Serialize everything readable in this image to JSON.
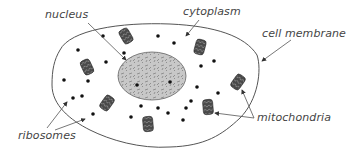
{
  "diagram": {
    "colors": {
      "membrane": "#555555",
      "nucleus_fill": "#c8c8c8",
      "nucleus_stroke": "#666666",
      "mitochondria_fill": "#4a4a4a",
      "ribosome": "#111111",
      "arrow": "#555555",
      "label": "#444444"
    },
    "labels": {
      "nucleus": "nucleus",
      "cytoplasm": "cytoplasm",
      "cell_membrane": "cell membrane",
      "mitochondria": "mitochondria",
      "ribosomes": "ribosomes"
    },
    "mitochondria": [
      {
        "x": 126,
        "y": 36,
        "rot": -30
      },
      {
        "x": 87,
        "y": 67,
        "rot": -25
      },
      {
        "x": 200,
        "y": 47,
        "rot": 15
      },
      {
        "x": 238,
        "y": 82,
        "rot": 35
      },
      {
        "x": 208,
        "y": 107,
        "rot": -5
      },
      {
        "x": 107,
        "y": 103,
        "rot": 35
      },
      {
        "x": 148,
        "y": 124,
        "rot": -5
      }
    ],
    "ribosomes": [
      {
        "x": 103,
        "y": 36
      },
      {
        "x": 158,
        "y": 36
      },
      {
        "x": 174,
        "y": 43
      },
      {
        "x": 78,
        "y": 50
      },
      {
        "x": 106,
        "y": 62
      },
      {
        "x": 64,
        "y": 80
      },
      {
        "x": 82,
        "y": 96
      },
      {
        "x": 73,
        "y": 98
      },
      {
        "x": 88,
        "y": 81
      },
      {
        "x": 93,
        "y": 114
      },
      {
        "x": 201,
        "y": 66
      },
      {
        "x": 214,
        "y": 61
      },
      {
        "x": 197,
        "y": 87
      },
      {
        "x": 218,
        "y": 93
      },
      {
        "x": 186,
        "y": 108
      },
      {
        "x": 191,
        "y": 101
      },
      {
        "x": 168,
        "y": 113
      },
      {
        "x": 141,
        "y": 106
      },
      {
        "x": 158,
        "y": 108
      },
      {
        "x": 137,
        "y": 85
      },
      {
        "x": 131,
        "y": 117
      },
      {
        "x": 170,
        "y": 82
      },
      {
        "x": 124,
        "y": 53
      },
      {
        "x": 183,
        "y": 120
      }
    ]
  }
}
